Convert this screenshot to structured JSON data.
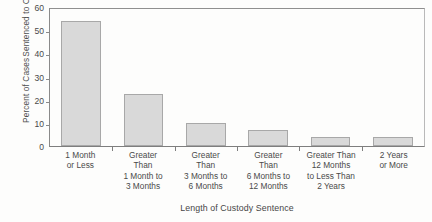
{
  "chart_data": {
    "type": "bar",
    "title": "",
    "xlabel": "Length of Custody Sentence",
    "ylabel": "Percent of Cases Sentenced to Custody",
    "ylabel_lines": [
      "Percent of Cases",
      "Sentenced to Custody"
    ],
    "categories": [
      "1 Month or Less",
      "Greater Than 1 Month to 3 Months",
      "Greater Than 3 Months to 6 Months",
      "Greater Than 6 Months to 12 Months",
      "Greater Than 12 Months to Less Than 2 Years",
      "2 Years or More"
    ],
    "category_label_lines": [
      [
        "1 Month",
        "or Less"
      ],
      [
        "Greater",
        "Than",
        "1 Month to",
        "3 Months"
      ],
      [
        "Greater",
        "Than",
        "3 Months to",
        "6 Months"
      ],
      [
        "Greater",
        "Than",
        "6 Months to",
        "12 Months"
      ],
      [
        "Greater Than",
        "12 Months",
        "to Less Than",
        "2 Years"
      ],
      [
        "2 Years",
        "or More"
      ]
    ],
    "values": [
      54,
      22.5,
      10,
      7,
      4,
      4
    ],
    "ylim": [
      0,
      60
    ],
    "yticks": [
      0,
      10,
      20,
      30,
      40,
      50,
      60
    ],
    "ytick_labels": [
      "0",
      "10",
      "20",
      "30",
      "40",
      "50",
      "60"
    ],
    "grid": false,
    "legend": null,
    "bar_color": "#d9d9d9",
    "bar_border_color": "#a8a8a8",
    "axis_color": "#8a8a8a",
    "background_color": "#fdfdfc"
  }
}
